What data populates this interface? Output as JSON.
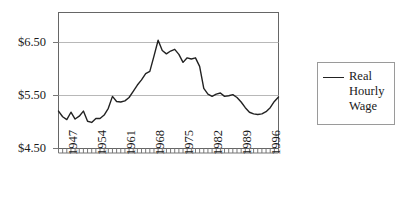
{
  "chart_data": {
    "type": "line",
    "title": "",
    "xlabel": "",
    "ylabel": "",
    "ylim": [
      4.5,
      6.9
    ],
    "yticks": [
      4.5,
      5.5,
      6.5
    ],
    "ytick_labels": [
      "$4.50",
      "$5.50",
      "$6.50"
    ],
    "grid": "horizontal",
    "legend_position": "right-outside",
    "xlim": [
      1947,
      2000
    ],
    "xticks": [
      1947,
      1954,
      1961,
      1968,
      1975,
      1982,
      1989,
      1996
    ],
    "xtick_labels": [
      "1947",
      "1954",
      "1961",
      "1968",
      "1975",
      "1982",
      "1989",
      "1996"
    ],
    "series": [
      {
        "name": "Real Hourly Wage",
        "color": "#222222",
        "x": [
          1947,
          1948,
          1949,
          1950,
          1951,
          1952,
          1953,
          1954,
          1955,
          1956,
          1957,
          1958,
          1959,
          1960,
          1961,
          1962,
          1963,
          1964,
          1965,
          1966,
          1967,
          1968,
          1969,
          1970,
          1971,
          1972,
          1973,
          1974,
          1975,
          1976,
          1977,
          1978,
          1979,
          1980,
          1981,
          1982,
          1983,
          1984,
          1985,
          1986,
          1987,
          1988,
          1989,
          1990,
          1991,
          1992,
          1993,
          1994,
          1995,
          1996,
          1997,
          1998,
          1999,
          2000
        ],
        "values": [
          5.16,
          5.06,
          5.01,
          5.14,
          5.02,
          5.07,
          5.16,
          4.98,
          4.96,
          5.03,
          5.03,
          5.09,
          5.21,
          5.42,
          5.33,
          5.32,
          5.34,
          5.4,
          5.51,
          5.62,
          5.71,
          5.82,
          5.86,
          6.13,
          6.41,
          6.23,
          6.17,
          6.22,
          6.25,
          6.16,
          6.02,
          6.1,
          6.08,
          6.1,
          5.95,
          5.56,
          5.46,
          5.42,
          5.46,
          5.48,
          5.42,
          5.43,
          5.45,
          5.4,
          5.32,
          5.22,
          5.14,
          5.11,
          5.1,
          5.11,
          5.15,
          5.22,
          5.33,
          5.41
        ],
        "units": "dollars per hour"
      }
    ]
  },
  "legend": {
    "entries": [
      {
        "label": "Real Hourly Wage",
        "marker": "line-sample"
      }
    ]
  },
  "axes": {
    "y_tick_labels": [
      "$6.50",
      "$5.50",
      "$4.50"
    ],
    "x_tick_labels": [
      "1947",
      "1954",
      "1961",
      "1968",
      "1975",
      "1982",
      "1989",
      "1996"
    ]
  },
  "colors": {
    "line": "#222222",
    "frame": "#555555",
    "gridline": "#b8b8b8",
    "tick": "#777777",
    "text": "#1a1a1a"
  }
}
